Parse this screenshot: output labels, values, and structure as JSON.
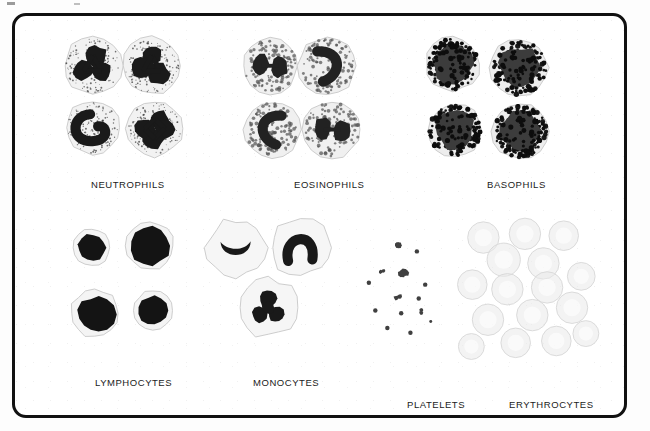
{
  "plate": {
    "title": "Blood Cell Types",
    "frame_color": "#111111",
    "background_color": "#ffffff",
    "width": 650,
    "height": 431
  },
  "groups": [
    {
      "id": "neutrophils",
      "label": "NEUTROPHILS",
      "label_x": 88,
      "label_y": 176,
      "row": "top",
      "cell_count": 4,
      "description": "Multilobed dark nucleus, pale cytoplasm with fine scattered granules",
      "nucleus_color": "#1a1a1a",
      "cytoplasm_color": "#f2f2f2",
      "granule_color": "#3a3a3a",
      "granule_size": "fine",
      "cells": [
        {
          "cx": 93,
          "cy": 68,
          "r": 31,
          "lobes": 3,
          "nucleus_style": "trilobed"
        },
        {
          "cx": 157,
          "cy": 68,
          "r": 31,
          "lobes": 3,
          "nucleus_style": "trilobed"
        },
        {
          "cx": 93,
          "cy": 135,
          "r": 29,
          "lobes": 2,
          "nucleus_style": "band"
        },
        {
          "cx": 160,
          "cy": 136,
          "r": 30,
          "lobes": 4,
          "nucleus_style": "hypersegmented"
        }
      ]
    },
    {
      "id": "eosinophils",
      "label": "EOSINOPHILS",
      "label_x": 291,
      "label_y": 176,
      "row": "top",
      "cell_count": 4,
      "description": "Bilobed nucleus, cytoplasm packed with coarse round granules",
      "nucleus_color": "#222222",
      "cytoplasm_color": "#f0f0f0",
      "granule_color": "#555555",
      "granule_size": "coarse",
      "cells": [
        {
          "cx": 285,
          "cy": 68,
          "r": 30,
          "lobes": 2,
          "nucleus_style": "bilobed"
        },
        {
          "cx": 347,
          "cy": 68,
          "r": 31,
          "lobes": 2,
          "nucleus_style": "curved-band"
        },
        {
          "cx": 287,
          "cy": 137,
          "r": 30,
          "lobes": 2,
          "nucleus_style": "c-shaped"
        },
        {
          "cx": 352,
          "cy": 137,
          "r": 31,
          "lobes": 2,
          "nucleus_style": "bilobed"
        }
      ]
    },
    {
      "id": "basophils",
      "label": "BASOPHILS",
      "label_x": 484,
      "label_y": 176,
      "row": "top",
      "cell_count": 4,
      "description": "Nucleus obscured by dense very dark coarse granules",
      "nucleus_color": "#3c3c3c",
      "cytoplasm_color": "#ededed",
      "granule_color": "#0d0d0d",
      "granule_size": "very-coarse",
      "cells": [
        {
          "cx": 483,
          "cy": 66,
          "r": 29,
          "lobes": 1,
          "nucleus_style": "obscured"
        },
        {
          "cx": 555,
          "cy": 70,
          "r": 31,
          "lobes": 1,
          "nucleus_style": "obscured"
        },
        {
          "cx": 485,
          "cy": 138,
          "r": 29,
          "lobes": 1,
          "nucleus_style": "obscured"
        },
        {
          "cx": 556,
          "cy": 139,
          "r": 30,
          "lobes": 1,
          "nucleus_style": "obscured"
        }
      ]
    },
    {
      "id": "lymphocytes",
      "label": "LYMPHOCYTES",
      "label_x": 92,
      "label_y": 374,
      "row": "bottom",
      "cell_count": 4,
      "description": "Large round dark nucleus with a thin rim of pale blue cytoplasm",
      "nucleus_color": "#141414",
      "cytoplasm_color": "#f4f4f4",
      "granule_color": "#8a8a8a",
      "granule_size": "none",
      "cells": [
        {
          "cx": 92,
          "cy": 265,
          "r": 20,
          "lobes": 1,
          "nucleus_style": "round"
        },
        {
          "cx": 155,
          "cy": 263,
          "r": 26,
          "lobes": 1,
          "nucleus_style": "round-large"
        },
        {
          "cx": 95,
          "cy": 336,
          "r": 26,
          "lobes": 1,
          "nucleus_style": "cleaved"
        },
        {
          "cx": 158,
          "cy": 333,
          "r": 21,
          "lobes": 1,
          "nucleus_style": "round"
        }
      ]
    },
    {
      "id": "monocytes",
      "label": "MONOCYTES",
      "label_x": 250,
      "label_y": 374,
      "row": "bottom",
      "cell_count": 3,
      "description": "Kidney or horseshoe shaped nucleus with abundant pale gray cytoplasm",
      "nucleus_color": "#191919",
      "cytoplasm_color": "#f6f6f6",
      "granule_color": "#9a9a9a",
      "granule_size": "none",
      "cells": [
        {
          "cx": 248,
          "cy": 265,
          "r": 32,
          "lobes": 1,
          "nucleus_style": "kidney"
        },
        {
          "cx": 318,
          "cy": 265,
          "r": 32,
          "lobes": 1,
          "nucleus_style": "horseshoe"
        },
        {
          "cx": 283,
          "cy": 330,
          "r": 33,
          "lobes": 1,
          "nucleus_style": "lobulated"
        }
      ]
    },
    {
      "id": "platelets",
      "label": "PLATELETS",
      "label_x": 404,
      "label_y": 396,
      "row": "bottom",
      "cell_count": 14,
      "description": "Small irregular anucleate dark fragments scattered on a pale field",
      "nucleus_color": "#2a2a2a",
      "cytoplasm_color": "#fafafa",
      "granule_color": "#1f1f1f",
      "granule_size": "tiny",
      "cells": [
        {
          "cx": 424,
          "cy": 260,
          "r": 6,
          "lobes": 0,
          "nucleus_style": "fragment"
        },
        {
          "cx": 444,
          "cy": 269,
          "r": 3,
          "lobes": 0,
          "nucleus_style": "dot"
        },
        {
          "cx": 406,
          "cy": 290,
          "r": 4,
          "lobes": 0,
          "nucleus_style": "fragment"
        },
        {
          "cx": 430,
          "cy": 291,
          "r": 7,
          "lobes": 0,
          "nucleus_style": "cluster"
        },
        {
          "cx": 392,
          "cy": 303,
          "r": 3,
          "lobes": 0,
          "nucleus_style": "dot"
        },
        {
          "cx": 453,
          "cy": 305,
          "r": 3,
          "lobes": 0,
          "nucleus_style": "dot"
        },
        {
          "cx": 424,
          "cy": 318,
          "r": 5,
          "lobes": 0,
          "nucleus_style": "fragment"
        },
        {
          "cx": 446,
          "cy": 320,
          "r": 3,
          "lobes": 0,
          "nucleus_style": "dot"
        },
        {
          "cx": 399,
          "cy": 333,
          "r": 3,
          "lobes": 0,
          "nucleus_style": "dot"
        },
        {
          "cx": 427,
          "cy": 336,
          "r": 3,
          "lobes": 0,
          "nucleus_style": "dot"
        },
        {
          "cx": 450,
          "cy": 334,
          "r": 4,
          "lobes": 0,
          "nucleus_style": "fragment"
        },
        {
          "cx": 412,
          "cy": 352,
          "r": 3,
          "lobes": 0,
          "nucleus_style": "dot"
        },
        {
          "cx": 437,
          "cy": 357,
          "r": 3,
          "lobes": 0,
          "nucleus_style": "dot"
        },
        {
          "cx": 459,
          "cy": 345,
          "r": 2,
          "lobes": 0,
          "nucleus_style": "dot"
        }
      ]
    },
    {
      "id": "erythrocytes",
      "label": "ERYTHROCYTES",
      "label_x": 506,
      "label_y": 396,
      "row": "bottom",
      "cell_count": 16,
      "description": "Pale gray anucleate biconcave discs with central pallor, overlapping",
      "nucleus_color": "none",
      "cytoplasm_color": "#eaeaea",
      "granule_color": "#d8d8d8",
      "granule_size": "none",
      "cells": [
        {
          "cx": 516,
          "cy": 254,
          "r": 17,
          "lobes": 0,
          "nucleus_style": "disc"
        },
        {
          "cx": 561,
          "cy": 250,
          "r": 17,
          "lobes": 0,
          "nucleus_style": "disc"
        },
        {
          "cx": 603,
          "cy": 252,
          "r": 16,
          "lobes": 0,
          "nucleus_style": "disc"
        },
        {
          "cx": 538,
          "cy": 278,
          "r": 18,
          "lobes": 0,
          "nucleus_style": "disc"
        },
        {
          "cx": 581,
          "cy": 282,
          "r": 17,
          "lobes": 0,
          "nucleus_style": "disc"
        },
        {
          "cx": 504,
          "cy": 305,
          "r": 16,
          "lobes": 0,
          "nucleus_style": "disc"
        },
        {
          "cx": 542,
          "cy": 310,
          "r": 17,
          "lobes": 0,
          "nucleus_style": "disc"
        },
        {
          "cx": 585,
          "cy": 308,
          "r": 17,
          "lobes": 0,
          "nucleus_style": "disc"
        },
        {
          "cx": 622,
          "cy": 296,
          "r": 15,
          "lobes": 0,
          "nucleus_style": "disc"
        },
        {
          "cx": 612,
          "cy": 330,
          "r": 17,
          "lobes": 0,
          "nucleus_style": "disc"
        },
        {
          "cx": 569,
          "cy": 338,
          "r": 17,
          "lobes": 0,
          "nucleus_style": "disc"
        },
        {
          "cx": 521,
          "cy": 343,
          "r": 17,
          "lobes": 0,
          "nucleus_style": "disc"
        },
        {
          "cx": 551,
          "cy": 368,
          "r": 16,
          "lobes": 0,
          "nucleus_style": "disc"
        },
        {
          "cx": 595,
          "cy": 366,
          "r": 16,
          "lobes": 0,
          "nucleus_style": "disc"
        },
        {
          "cx": 503,
          "cy": 372,
          "r": 14,
          "lobes": 0,
          "nucleus_style": "disc"
        },
        {
          "cx": 627,
          "cy": 358,
          "r": 14,
          "lobes": 0,
          "nucleus_style": "disc"
        }
      ]
    }
  ]
}
